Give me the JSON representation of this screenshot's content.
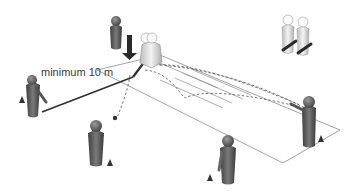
{
  "diagram": {
    "type": "drill-illustration",
    "annotation": {
      "text": "minimum 10 m",
      "x": 41,
      "y": 66
    },
    "colors": {
      "player_dark": "#555555",
      "player_light": "#d8d8d8",
      "field_line": "#8a8a8a",
      "distance_line": "#2e2e2e",
      "arrow": "#2a2a2a"
    },
    "elements": {
      "field": "pitch-outline",
      "players_dark": 5,
      "players_light": 3,
      "cones": 4,
      "ball": 1,
      "arrow": "down-arrow"
    }
  }
}
